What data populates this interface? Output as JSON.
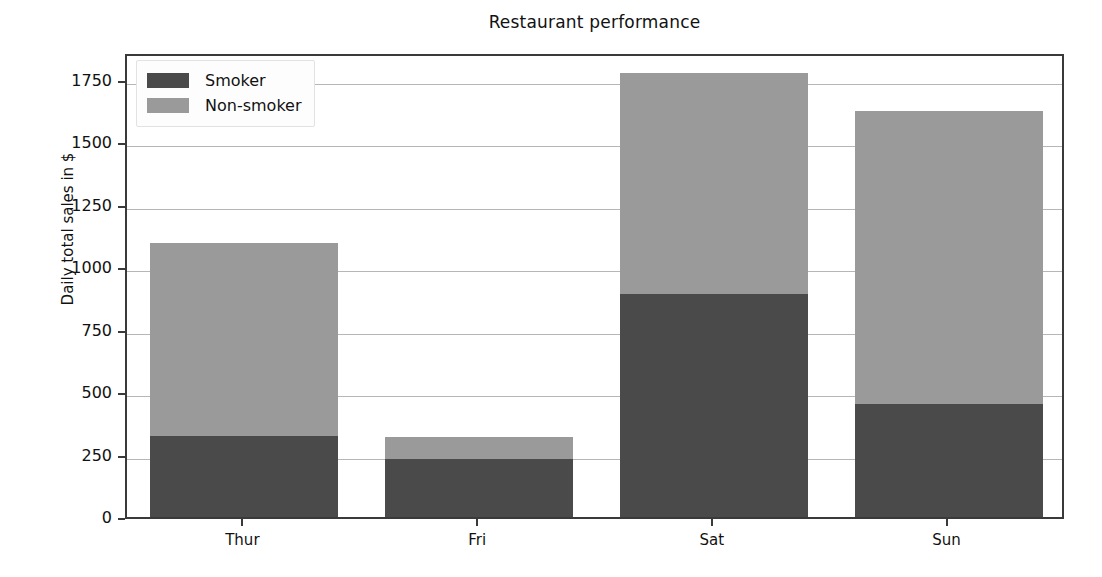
{
  "chart_data": {
    "type": "bar",
    "subtype": "stacked-bar",
    "title": "Restaurant performance",
    "xlabel": "",
    "ylabel": "Daily total sales in $",
    "categories": [
      "Thur",
      "Fri",
      "Sat",
      "Sun"
    ],
    "series": [
      {
        "name": "Smoker",
        "color": "#4a4a4a",
        "values": [
          325,
          233,
          893,
          453
        ]
      },
      {
        "name": "Non-smoker",
        "color": "#9a9a9a",
        "values": [
          771,
          88,
          885,
          1173
        ]
      }
    ],
    "totals": [
      1096,
      321,
      1778,
      1626
    ],
    "ylim": [
      0,
      1860
    ],
    "yticks": [
      0,
      250,
      500,
      750,
      1000,
      1250,
      1500,
      1750
    ],
    "ytick_labels": [
      "0",
      "250",
      "500",
      "750",
      "1000",
      "1250",
      "1500",
      "1750"
    ],
    "grid": "horizontal",
    "legend_position": "upper left",
    "bar_width_fraction": 0.8
  },
  "legend": {
    "entries": [
      {
        "label": "Smoker",
        "color": "#4a4a4a"
      },
      {
        "label": "Non-smoker",
        "color": "#9a9a9a"
      }
    ]
  },
  "axes": {
    "frame_color": "#3a3a3a",
    "grid_color": "#b6b6b6",
    "background": "#ffffff"
  }
}
